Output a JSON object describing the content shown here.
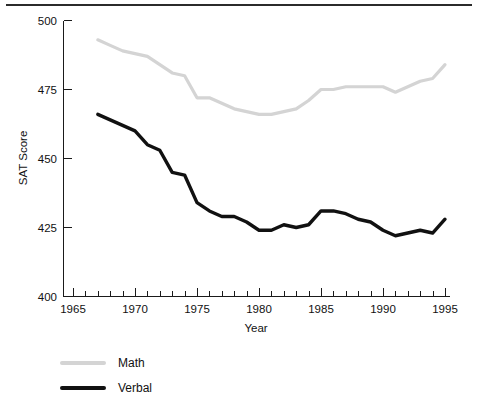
{
  "chart_data": {
    "type": "line",
    "title": "",
    "xlabel": "Year",
    "ylabel": "SAT Score",
    "xlim": [
      1965,
      1995
    ],
    "ylim": [
      400,
      500
    ],
    "grid": false,
    "legend_position": "bottom-left",
    "x_ticks_major": [
      1965,
      1970,
      1975,
      1980,
      1985,
      1990,
      1995
    ],
    "x_ticks_minor_step": 1,
    "y_ticks": [
      400,
      425,
      450,
      475,
      500
    ],
    "x": [
      1967,
      1968,
      1969,
      1970,
      1971,
      1972,
      1973,
      1974,
      1975,
      1976,
      1977,
      1978,
      1979,
      1980,
      1981,
      1982,
      1983,
      1984,
      1985,
      1986,
      1987,
      1988,
      1989,
      1990,
      1991,
      1992,
      1993,
      1994,
      1995
    ],
    "series": [
      {
        "name": "Math",
        "color": "#d4d4d4",
        "values": [
          493,
          491,
          489,
          488,
          487,
          484,
          481,
          480,
          472,
          472,
          470,
          468,
          467,
          466,
          466,
          467,
          468,
          471,
          475,
          475,
          476,
          476,
          476,
          476,
          474,
          476,
          478,
          479,
          484
        ]
      },
      {
        "name": "Verbal",
        "color": "#111111",
        "values": [
          466,
          464,
          462,
          460,
          455,
          453,
          445,
          444,
          434,
          431,
          429,
          429,
          427,
          424,
          424,
          426,
          425,
          426,
          431,
          431,
          430,
          428,
          427,
          424,
          422,
          423,
          424,
          423,
          428
        ]
      }
    ]
  },
  "legend": {
    "entries": [
      {
        "label": "Math"
      },
      {
        "label": "Verbal"
      }
    ]
  },
  "axes": {
    "y_title": "SAT Score",
    "x_title": "Year",
    "y_tick_labels": [
      "500",
      "475",
      "450",
      "425",
      "400"
    ],
    "x_tick_labels": [
      "1965",
      "1970",
      "1975",
      "1980",
      "1985",
      "1990",
      "1995"
    ]
  }
}
